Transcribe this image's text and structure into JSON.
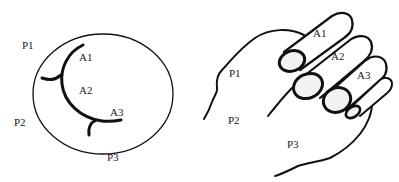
{
  "left_panel": {
    "labels": {
      "p1": "P1",
      "p2": "P2",
      "p3": "P3",
      "a1": "A1",
      "a2": "A2",
      "a3": "A3"
    }
  },
  "right_panel": {
    "labels": {
      "p1": "P1",
      "p2": "P2",
      "p3": "P3",
      "a1": "A1",
      "a2": "A2",
      "a3": "A3"
    }
  },
  "colors": {
    "stroke": "#111111",
    "background": "#ffffff",
    "fill_light": "#f2f2f2"
  }
}
